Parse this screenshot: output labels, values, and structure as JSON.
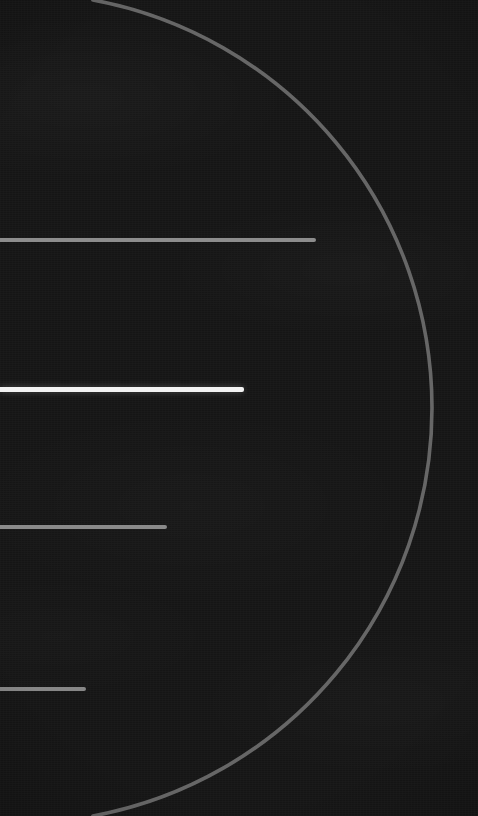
{
  "screen": {
    "width": 478,
    "height": 816,
    "background_color": "#151515",
    "theme": "dark",
    "title": ""
  },
  "decoration": {
    "arc": {
      "name": "progress-arc",
      "stroke_color": "#6e6e6e",
      "stroke_width": 3.6,
      "center_x": 17,
      "center_y": 408,
      "radius": 415,
      "entry_top_x": 178,
      "rightmost_x": 432,
      "rightmost_y": 408,
      "exit_bottom_x": 196,
      "opacity": 0.92
    },
    "vignette_color": "#000000"
  },
  "bars": [
    {
      "name": "bar-1",
      "label": "",
      "x": 0,
      "y": 238,
      "width": 316,
      "height": 4,
      "color": "#8d8d8d",
      "state": "inactive"
    },
    {
      "name": "bar-2",
      "label": "",
      "x": 0,
      "y": 387,
      "width": 244,
      "height": 5,
      "color": "#f2f2f2",
      "state": "active"
    },
    {
      "name": "bar-3",
      "label": "",
      "x": 0,
      "y": 525,
      "width": 167,
      "height": 4,
      "color": "#8a8a8a",
      "state": "inactive"
    },
    {
      "name": "bar-4",
      "label": "",
      "x": 0,
      "y": 687,
      "width": 86,
      "height": 4,
      "color": "#878787",
      "state": "inactive"
    }
  ]
}
